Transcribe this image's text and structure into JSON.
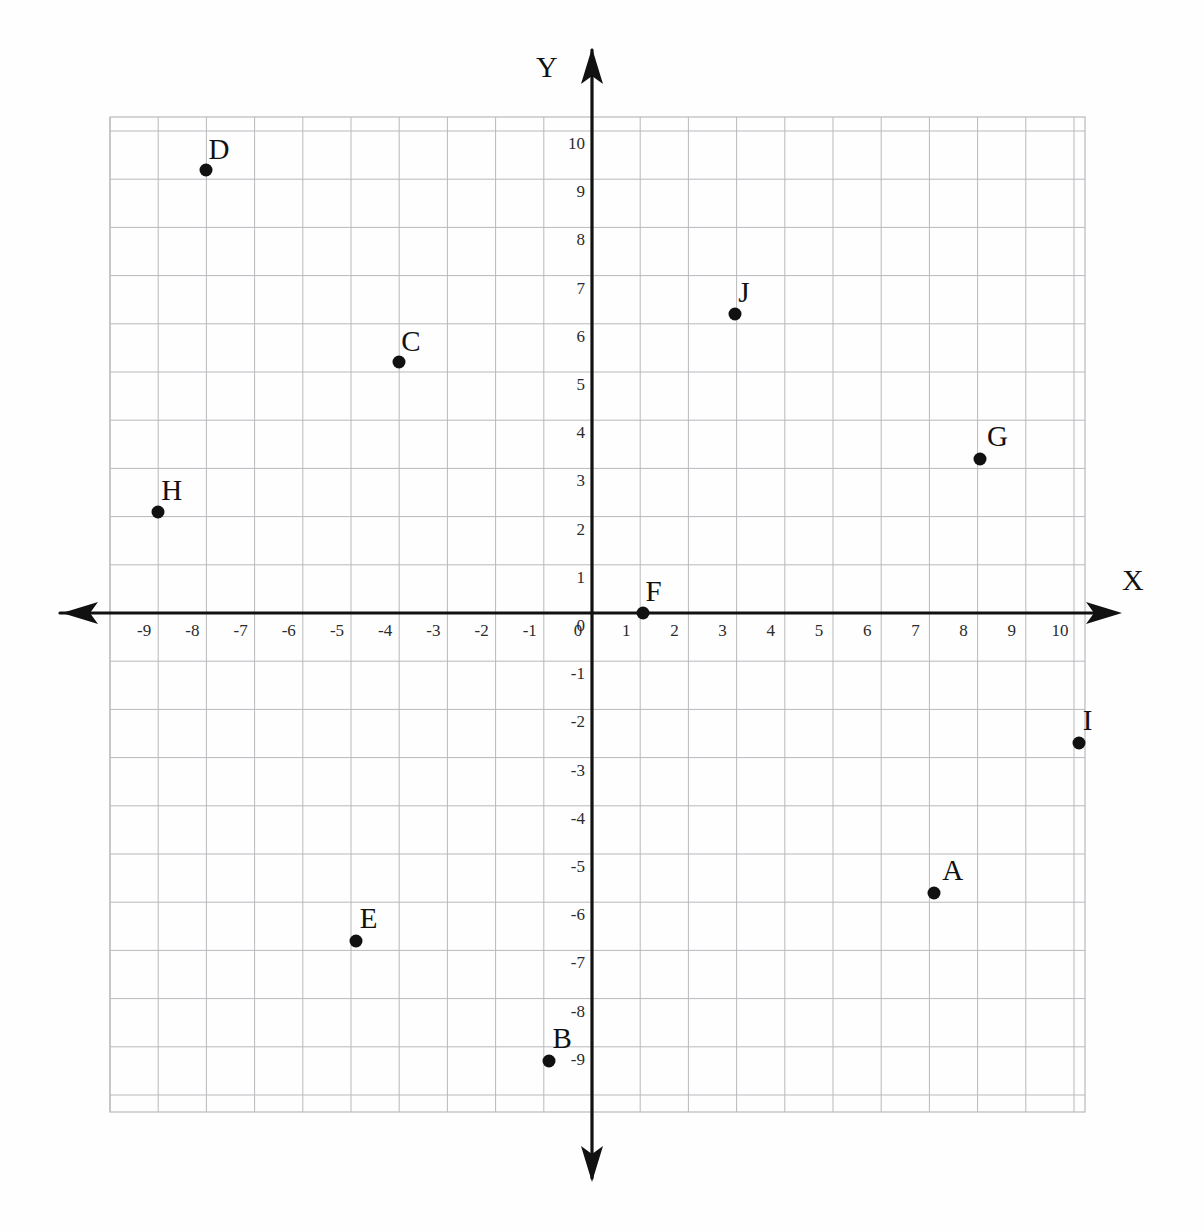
{
  "figure": {
    "title": "",
    "x_axis_name": "X",
    "y_axis_name": "Y"
  },
  "axes": {
    "x_ticks": [
      "-9",
      "-8",
      "-7",
      "-6",
      "-5",
      "-4",
      "-3",
      "-2",
      "-1",
      "0",
      "1",
      "2",
      "3",
      "4",
      "5",
      "6",
      "7",
      "8",
      "9",
      "10"
    ],
    "y_ticks": [
      "10",
      "9",
      "8",
      "7",
      "6",
      "5",
      "4",
      "3",
      "2",
      "1",
      "0",
      "-1",
      "-2",
      "-3",
      "-4",
      "-5",
      "-6",
      "-7",
      "-8",
      "-9"
    ]
  },
  "colors": {
    "axis": "#111111",
    "grid": "#b9b9bd",
    "point": "#111111",
    "label": "#111111",
    "tick": "#2b2b2b",
    "background": "#fefefe"
  },
  "chart_data": {
    "type": "scatter",
    "title": "",
    "xlabel": "X",
    "ylabel": "Y",
    "xlim": [
      -10,
      10.2
    ],
    "ylim": [
      -10.3,
      10.3
    ],
    "grid": true,
    "legend": "none",
    "x_ticks": [
      -9,
      -8,
      -7,
      -6,
      -5,
      -4,
      -3,
      -2,
      -1,
      0,
      1,
      2,
      3,
      4,
      5,
      6,
      7,
      8,
      9,
      10
    ],
    "y_ticks": [
      10,
      9,
      8,
      7,
      6,
      5,
      4,
      3,
      2,
      1,
      0,
      -1,
      -2,
      -3,
      -4,
      -5,
      -6,
      -7,
      -8,
      -9
    ],
    "points": [
      {
        "label": "A",
        "x": 7.1,
        "y": -5.8,
        "label_dx": 14,
        "label_dy": -8
      },
      {
        "label": "B",
        "x": -0.9,
        "y": -9.3,
        "label_dx": 10,
        "label_dy": -8
      },
      {
        "label": "C",
        "x": -4.0,
        "y": 5.2,
        "label_dx": 8,
        "label_dy": -6
      },
      {
        "label": "D",
        "x": -8.0,
        "y": 9.2,
        "label_dx": 8,
        "label_dy": -6
      },
      {
        "label": "E",
        "x": -4.9,
        "y": -6.8,
        "label_dx": 10,
        "label_dy": -8
      },
      {
        "label": "F",
        "x": 1.05,
        "y": 0.0,
        "label_dx": 9,
        "label_dy": -7
      },
      {
        "label": "G",
        "x": 8.05,
        "y": 3.2,
        "label_dx": 13,
        "label_dy": -8
      },
      {
        "label": "H",
        "x": -9.0,
        "y": 2.1,
        "label_dx": 9,
        "label_dy": -7
      },
      {
        "label": "I",
        "x": 10.1,
        "y": -2.7,
        "label_dx": 10,
        "label_dy": -8
      },
      {
        "label": "J",
        "x": 2.97,
        "y": 6.2,
        "label_dx": 9,
        "label_dy": -7
      }
    ]
  },
  "geometry": {
    "origin_x": 592,
    "origin_y": 613,
    "unit": 48.2,
    "grid_left": 110,
    "grid_right": 1085,
    "grid_top": 117,
    "grid_bottom": 1112,
    "x_axis_label_pos": {
      "x": 1122,
      "y": 565
    },
    "y_axis_label_pos": {
      "x": 536,
      "y": 52
    }
  }
}
